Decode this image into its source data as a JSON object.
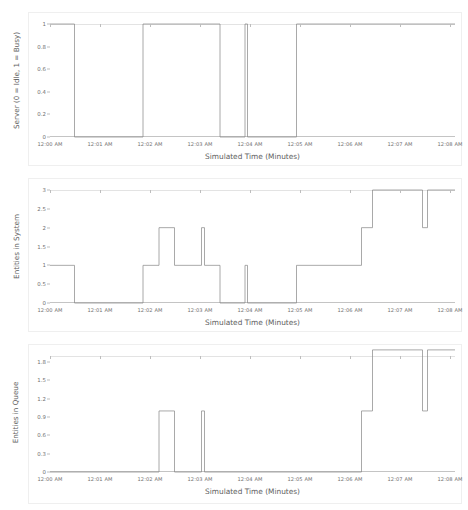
{
  "figure": {
    "background": "#ffffff",
    "line_color": "#8c8c8c",
    "axis_color": "#bdbdbd",
    "text_color": "#6f6f6f"
  },
  "chart_data": [
    {
      "type": "line",
      "drawstyle": "steps-post",
      "title": "",
      "xlabel": "Simulated Time (Minutes)",
      "ylabel": "Server (0 = Idle, 1 = Busy)",
      "xtick_labels": [
        "12:00 AM",
        "12:01 AM",
        "12:02 AM",
        "12:03 AM",
        "12:04 AM",
        "12:05 AM",
        "12:06 AM",
        "12:07 AM",
        "12:08 AM"
      ],
      "xtick_values": [
        0,
        1,
        2,
        3,
        4,
        5,
        6,
        7,
        8
      ],
      "ytick_labels": [
        "0",
        "0.2",
        "0.4",
        "0.6",
        "0.8",
        "1"
      ],
      "ytick_values": [
        0,
        0.2,
        0.4,
        0.6,
        0.8,
        1
      ],
      "xlim": [
        0,
        8.1
      ],
      "ylim": [
        0,
        1
      ],
      "grid": false,
      "legend": null,
      "x": [
        0.0,
        0.49,
        1.86,
        3.4,
        3.9,
        3.95,
        4.93,
        8.1
      ],
      "y": [
        1,
        0,
        1,
        0,
        1,
        0,
        1,
        1
      ]
    },
    {
      "type": "line",
      "drawstyle": "steps-post",
      "title": "",
      "xlabel": "Simulated Time (Minutes)",
      "ylabel": "Entities in System",
      "xtick_labels": [
        "12:00 AM",
        "12:01 AM",
        "12:02 AM",
        "12:03 AM",
        "12:04 AM",
        "12:05 AM",
        "12:06 AM",
        "12:07 AM",
        "12:08 AM"
      ],
      "xtick_values": [
        0,
        1,
        2,
        3,
        4,
        5,
        6,
        7,
        8
      ],
      "ytick_labels": [
        "0",
        "0.5",
        "1",
        "1.5",
        "2",
        "2.5",
        "3"
      ],
      "ytick_values": [
        0,
        0.5,
        1,
        1.5,
        2,
        2.5,
        3
      ],
      "xlim": [
        0,
        8.1
      ],
      "ylim": [
        0,
        3
      ],
      "grid": false,
      "legend": null,
      "x": [
        0.0,
        0.49,
        1.86,
        2.18,
        2.49,
        3.03,
        3.09,
        3.4,
        3.9,
        3.95,
        4.93,
        6.23,
        6.45,
        7.45,
        7.55,
        8.1
      ],
      "y": [
        1,
        0,
        1,
        2,
        1,
        2,
        1,
        0,
        1,
        0,
        1,
        2,
        3,
        2,
        3,
        3
      ]
    },
    {
      "type": "line",
      "drawstyle": "steps-post",
      "title": "",
      "xlabel": "Simulated Time (Minutes)",
      "ylabel": "Entities in Queue",
      "xtick_labels": [
        "12:00 AM",
        "12:01 AM",
        "12:02 AM",
        "12:03 AM",
        "12:04 AM",
        "12:05 AM",
        "12:06 AM",
        "12:07 AM",
        "12:08 AM"
      ],
      "xtick_values": [
        0,
        1,
        2,
        3,
        4,
        5,
        6,
        7,
        8
      ],
      "ytick_labels": [
        "0",
        "0.3",
        "0.6",
        "0.9",
        "1.2",
        "1.5",
        "1.8"
      ],
      "ytick_values": [
        0,
        0.3,
        0.6,
        0.9,
        1.2,
        1.5,
        1.8
      ],
      "xlim": [
        0,
        8.1
      ],
      "ylim": [
        0,
        1.9
      ],
      "grid": false,
      "legend": null,
      "x": [
        0.0,
        2.18,
        2.49,
        3.03,
        3.09,
        6.23,
        6.45,
        7.45,
        7.55,
        8.1
      ],
      "y": [
        0,
        1,
        0,
        1,
        0,
        1,
        2,
        1,
        2,
        2
      ]
    }
  ]
}
